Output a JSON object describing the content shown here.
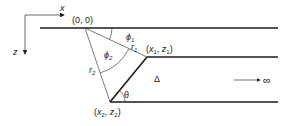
{
  "diagram": {
    "axes": {
      "x_label": "x",
      "z_label": "z"
    },
    "points": {
      "origin": "(0, 0)",
      "p1": {
        "x": "x",
        "x_sub": "1",
        "z": "z",
        "z_sub": "1"
      },
      "p2": {
        "x": "x",
        "x_sub": "2",
        "z": "z",
        "z_sub": "2"
      }
    },
    "labels": {
      "phi1": "ϕ",
      "phi1_sub": "1",
      "phi2": "ϕ",
      "phi2_sub": "2",
      "r1": "r",
      "r1_sub": "1",
      "r2": "r",
      "r2_sub": "2",
      "theta": "θ",
      "delta": "Δ",
      "infinity": "∞"
    },
    "colors": {
      "line": "#1a1a1a",
      "thin": "#444444",
      "background": "#ffffff"
    }
  }
}
